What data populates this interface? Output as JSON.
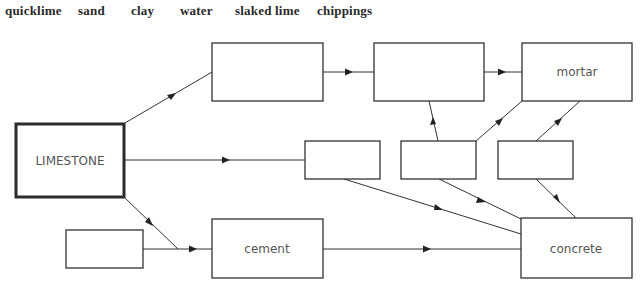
{
  "word_bank": {
    "items": [
      {
        "label": "quicklime",
        "x": 5
      },
      {
        "label": "sand",
        "x": 78
      },
      {
        "label": "clay",
        "x": 131
      },
      {
        "label": "water",
        "x": 180
      },
      {
        "label": "slaked lime",
        "x": 235
      },
      {
        "label": "chippings",
        "x": 317
      }
    ]
  },
  "diagram": {
    "boxes": {
      "limestone": {
        "label": "LIMESTONE"
      },
      "top_a": {
        "label": ""
      },
      "top_b": {
        "label": ""
      },
      "mortar": {
        "label": "mortar"
      },
      "mid_c": {
        "label": ""
      },
      "mid_d": {
        "label": ""
      },
      "mid_e": {
        "label": ""
      },
      "bottom_left": {
        "label": ""
      },
      "cement": {
        "label": "cement"
      },
      "concrete": {
        "label": "concrete"
      }
    }
  }
}
